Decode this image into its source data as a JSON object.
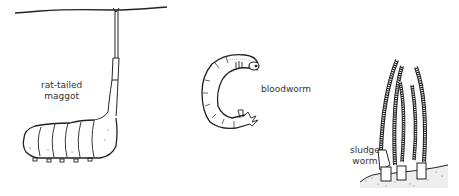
{
  "diagram": {
    "type": "illustration",
    "colors": {
      "ink": "#222222",
      "label": "#333333",
      "background": "#ffffff"
    },
    "organisms": [
      {
        "id": "rat-tailed-maggot",
        "label_line1": "rat-tailed",
        "label_line2": "maggot"
      },
      {
        "id": "bloodworm",
        "label": "bloodworm"
      },
      {
        "id": "sludge-worm",
        "label_line1": "sludge",
        "label_line2": "worm"
      }
    ]
  }
}
